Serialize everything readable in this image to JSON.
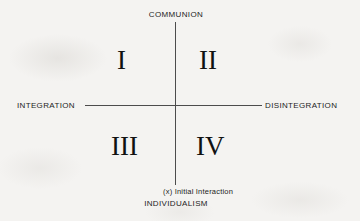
{
  "figure": {
    "type": "quadrant-diagram",
    "background_color": "#f4f3f1",
    "axis_color": "#4c4c4c",
    "text_color": "#1d1d1d"
  },
  "axes": {
    "vertical": {
      "top_label": "COMMUNION",
      "bottom_label": "INDIVIDUALISM"
    },
    "horizontal": {
      "left_label": "INTEGRATION",
      "right_label": "DISINTEGRATION"
    }
  },
  "quadrants": [
    {
      "id": "i",
      "numeral": "I",
      "position": "upper-left"
    },
    {
      "id": "ii",
      "numeral": "II",
      "position": "upper-right"
    },
    {
      "id": "iii",
      "numeral": "III",
      "position": "lower-left"
    },
    {
      "id": "iv",
      "numeral": "IV",
      "position": "lower-right"
    }
  ],
  "annotations": [
    {
      "id": "initial-interaction",
      "text": "(x) Initial Interaction"
    }
  ],
  "chart_data": {
    "type": "scatter",
    "title": "",
    "xlabel": "",
    "ylabel": "",
    "x_axis": {
      "negative_pole": "INTEGRATION",
      "positive_pole": "DISINTEGRATION"
    },
    "y_axis": {
      "negative_pole": "INDIVIDUALISM",
      "positive_pole": "COMMUNION"
    },
    "grid": false,
    "legend": "none",
    "quadrant_labels": [
      "I",
      "II",
      "III",
      "IV"
    ],
    "annotations": [
      "(x) Initial Interaction"
    ],
    "points": [
      {
        "label": "(x) Initial Interaction",
        "x": 0,
        "y": 0
      }
    ]
  }
}
